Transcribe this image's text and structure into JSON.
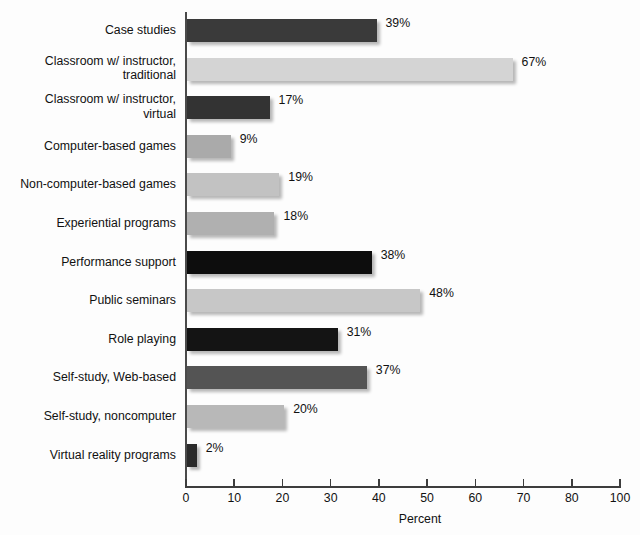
{
  "chart_data": {
    "type": "bar",
    "orientation": "horizontal",
    "title": "",
    "xlabel": "Percent",
    "ylabel": "",
    "xlim": [
      0,
      100
    ],
    "grid": false,
    "legend": null,
    "categories": [
      "Case studies",
      "Classroom w/ instructor,\ntraditional",
      "Classroom w/ instructor,\nvirtual",
      "Computer-based games",
      "Non-computer-based games",
      "Experiential programs",
      "Performance support",
      "Public seminars",
      "Role playing",
      "Self-study, Web-based",
      "Self-study, noncomputer",
      "Virtual reality programs"
    ],
    "values": [
      39,
      67,
      17,
      9,
      19,
      18,
      38,
      48,
      31,
      37,
      20,
      2
    ],
    "value_labels": [
      "39%",
      "67%",
      "17%",
      "9%",
      "19%",
      "18%",
      "38%",
      "48%",
      "31%",
      "37%",
      "20%",
      "2%"
    ],
    "bar_colors": [
      "#3a3a3a",
      "#d4d4d4",
      "#333333",
      "#aaaaaa",
      "#c2c2c2",
      "#b0b0b0",
      "#0d0d0d",
      "#c7c7c7",
      "#141414",
      "#545454",
      "#b8b8b8",
      "#2b2b2b"
    ],
    "xticks": [
      0,
      10,
      20,
      30,
      40,
      50,
      60,
      70,
      80,
      100
    ],
    "xtick_labels": [
      "0",
      "10",
      "20",
      "30",
      "40",
      "50",
      "60",
      "70",
      "80",
      "100"
    ]
  },
  "style": {
    "background": "#fdfdfd",
    "axis_color": "#3d3d3d",
    "text_color": "#111111"
  }
}
